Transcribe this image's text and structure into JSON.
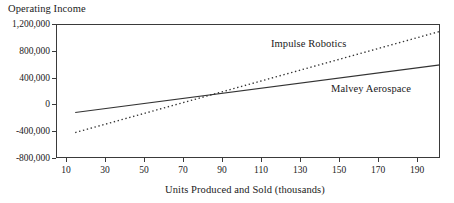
{
  "chart_data": {
    "type": "line",
    "title": "",
    "ylabel": "Operating Income",
    "xlabel": "Units Produced and Sold (thousands)",
    "xlim": [
      0,
      200
    ],
    "ylim": [
      -800000,
      1200000
    ],
    "grid": false,
    "legend_position": "inline-annotations",
    "x_ticks": [
      10,
      30,
      50,
      70,
      90,
      110,
      130,
      150,
      170,
      190
    ],
    "x_tick_labels": [
      "10",
      "30",
      "50",
      "70",
      "90",
      "110",
      "130",
      "150",
      "170",
      "190"
    ],
    "y_ticks": [
      -800000,
      -400000,
      0,
      400000,
      800000,
      1200000
    ],
    "y_tick_labels": [
      "-800,000",
      "-400,000",
      "0",
      "400,000",
      "800,000",
      "1,200,000"
    ],
    "series": [
      {
        "name": "Impulse Robotics",
        "style": "dotted",
        "color": "#333333",
        "x": [
          10,
          200
        ],
        "values": [
          -420000,
          1090000
        ],
        "label_text": "Impulse Robotics"
      },
      {
        "name": "Malvey Aerospace",
        "style": "solid",
        "color": "#333333",
        "x": [
          10,
          200
        ],
        "values": [
          -120000,
          590000
        ],
        "label_text": "Malvey Aerospace"
      }
    ],
    "annotations": [
      {
        "text": "Impulse Robotics",
        "x": 105,
        "y": 760000
      },
      {
        "text": "Malvey Aerospace",
        "x": 175,
        "y": 120000
      }
    ],
    "breakeven_note": "Lines intersect near 88 thousand units at approximately 30,000"
  },
  "axes": {
    "frame_color": "#3a3a3a",
    "background": "#ffffff"
  }
}
